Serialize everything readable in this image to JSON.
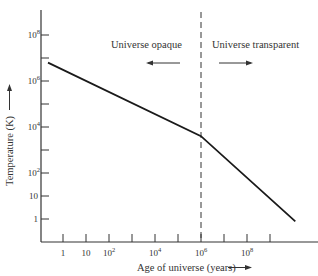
{
  "chart_data": {
    "type": "line",
    "title": "",
    "xlabel": "Age of universe (years)",
    "ylabel": "Temperature (K)",
    "x_scale": "log",
    "y_scale": "log",
    "x_ticks": [
      {
        "exp": 0,
        "label": "1"
      },
      {
        "exp": 1,
        "label": "10"
      },
      {
        "exp": 2,
        "label": "10",
        "sup": "2"
      },
      {
        "exp": 3,
        "label": ""
      },
      {
        "exp": 4,
        "label": "10",
        "sup": "4"
      },
      {
        "exp": 5,
        "label": ""
      },
      {
        "exp": 6,
        "label": "10",
        "sup": "6"
      },
      {
        "exp": 7,
        "label": ""
      },
      {
        "exp": 8,
        "label": "10",
        "sup": "8"
      },
      {
        "exp": 9,
        "label": ""
      }
    ],
    "y_ticks": [
      {
        "exp": 0,
        "label": "1"
      },
      {
        "exp": 1,
        "label": "10"
      },
      {
        "exp": 2,
        "label": "10",
        "sup": "2"
      },
      {
        "exp": 3,
        "label": ""
      },
      {
        "exp": 4,
        "label": "10",
        "sup": "4"
      },
      {
        "exp": 5,
        "label": ""
      },
      {
        "exp": 6,
        "label": "10",
        "sup": "6"
      },
      {
        "exp": 7,
        "label": ""
      },
      {
        "exp": 8,
        "label": "10",
        "sup": "8"
      }
    ],
    "series": [
      {
        "name": "Temperature",
        "points": [
          {
            "log_age": -0.65,
            "log_temp": 6.8
          },
          {
            "log_age": 6.0,
            "log_temp": 3.6
          },
          {
            "log_age": 10.1,
            "log_temp": -0.1
          }
        ]
      }
    ],
    "divider": {
      "log_age": 6.0,
      "style": "dashed"
    },
    "annotations": [
      {
        "text": "Universe opaque",
        "arrow": "left"
      },
      {
        "text": "Universe transparent",
        "arrow": "right"
      }
    ],
    "grid": false,
    "legend": "none"
  }
}
